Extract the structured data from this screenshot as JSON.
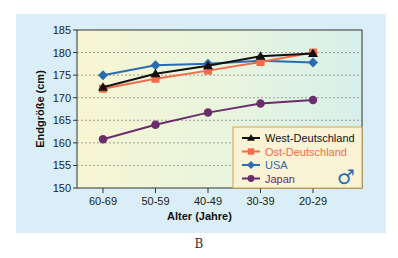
{
  "chart_data": {
    "type": "line",
    "title": "",
    "xlabel": "Alter (Jahre)",
    "ylabel": "Endgröße (cm)",
    "categories": [
      "60-69",
      "50-59",
      "40-49",
      "30-39",
      "20-29"
    ],
    "ylim": [
      150,
      185
    ],
    "yticks": [
      150,
      155,
      160,
      165,
      170,
      175,
      180,
      185
    ],
    "grid": "horizontal dashed",
    "legend_position": "lower right inside",
    "series": [
      {
        "name": "West-Deutschland",
        "color": "#111111",
        "marker": "triangle",
        "values": [
          172.3,
          175.3,
          177.1,
          179.2,
          179.8
        ]
      },
      {
        "name": "Ost-Deutschland",
        "color": "#f26b4a",
        "marker": "square",
        "values": [
          172.0,
          174.2,
          176.0,
          177.9,
          180.0
        ]
      },
      {
        "name": "USA",
        "color": "#2b6cb0",
        "marker": "diamond",
        "values": [
          175.0,
          177.2,
          177.5,
          178.2,
          177.8
        ]
      },
      {
        "name": "Japan",
        "color": "#6b2d6b",
        "marker": "circle",
        "values": [
          160.8,
          164.0,
          166.7,
          168.7,
          169.5
        ]
      }
    ],
    "annotations": [
      "male-symbol"
    ]
  },
  "caption": "B",
  "legend_symbol": "♂"
}
